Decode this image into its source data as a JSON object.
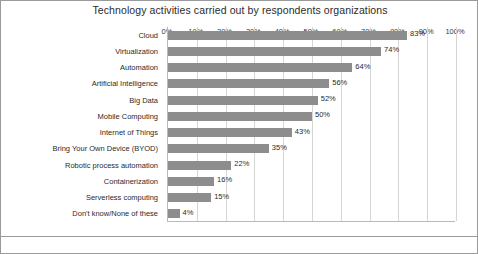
{
  "chart_data": {
    "type": "bar",
    "orientation": "horizontal",
    "title": "Technology activities carried out by respondents organizations",
    "xlabel": "",
    "ylabel": "",
    "xlim": [
      0,
      100
    ],
    "xticks": [
      0,
      10,
      20,
      30,
      40,
      50,
      60,
      70,
      80,
      90,
      100
    ],
    "xtick_labels": [
      "0%",
      "10%",
      "20%",
      "30%",
      "40%",
      "50%",
      "60%",
      "70%",
      "80%",
      "90%",
      "100%"
    ],
    "grid": true,
    "grid_axis": "x",
    "legend": false,
    "bar_color": "#8d8d8d",
    "categories": [
      "Cloud",
      "Virtualization",
      "Automation",
      "Artificial Intelligence",
      "Big Data",
      "Mobile Computing",
      "Internet of Things",
      "Bring Your Own Device (BYOD)",
      "Robotic process automation",
      "Containerization",
      "Serverless computing",
      "Don't know/None of these"
    ],
    "values": [
      83,
      74,
      64,
      56,
      52,
      50,
      43,
      35,
      22,
      16,
      15,
      4
    ],
    "data_labels": [
      "83%",
      "74%",
      "64%",
      "56%",
      "52%",
      "50%",
      "43%",
      "35%",
      "22%",
      "16%",
      "15%",
      "4%"
    ]
  }
}
